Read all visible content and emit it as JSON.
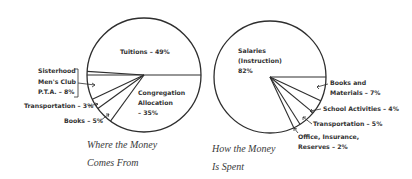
{
  "chart_data": [
    {
      "type": "pie",
      "title": "Where the Money Comes From",
      "caption_lines": [
        "Where the Money",
        "Comes From"
      ],
      "start_angle_deg": 0,
      "direction": "counterclockwise",
      "categories": [
        "Tuitions",
        "Sisterhood / Men's Club / P.T.A.",
        "Transportation",
        "Books",
        "Congregation Allocation"
      ],
      "values": [
        49,
        8,
        3,
        5,
        35
      ],
      "unit": "%",
      "labels": [
        {
          "lines": [
            "Tuitions – 49%"
          ],
          "x": 120,
          "y": 54,
          "anchor": "start"
        },
        {
          "lines": [
            "Sisterhood",
            "Men's Club",
            "P.T.A. – 8%"
          ],
          "x": 38,
          "y": 73,
          "anchor": "start",
          "line_height": 10.5
        },
        {
          "lines": [
            "Transportation – 3%"
          ],
          "x": 24,
          "y": 108,
          "anchor": "start"
        },
        {
          "lines": [
            "Books – 5%"
          ],
          "x": 64,
          "y": 123,
          "anchor": "start"
        },
        {
          "lines": [
            "Congregation",
            "Allocation",
            "– 35%"
          ],
          "x": 138,
          "y": 95,
          "anchor": "start",
          "line_height": 10
        }
      ]
    },
    {
      "type": "pie",
      "title": "How the Money Is Spent",
      "caption_lines": [
        "How the Money",
        "Is Spent"
      ],
      "start_angle_deg": 0,
      "direction": "clockwise",
      "categories": [
        "Books and Materials",
        "School Activities",
        "Transportation",
        "Office, Insurance, Reserves",
        "Salaries (Instruction)"
      ],
      "values": [
        7,
        4,
        5,
        2,
        82
      ],
      "unit": "%",
      "labels": [
        {
          "lines": [
            "Books and",
            "Materials – 7%"
          ],
          "x": 330,
          "y": 85,
          "anchor": "start",
          "line_height": 10
        },
        {
          "lines": [
            "School Activities – 4%"
          ],
          "x": 323,
          "y": 111,
          "anchor": "start"
        },
        {
          "lines": [
            "Transportation – 5%"
          ],
          "x": 313,
          "y": 126,
          "anchor": "start"
        },
        {
          "lines": [
            "Office, Insurance,",
            "Reserves – 2%"
          ],
          "x": 298,
          "y": 139,
          "anchor": "start",
          "line_height": 10
        },
        {
          "lines": [
            "Salaries",
            "(Instruction)",
            "82%"
          ],
          "x": 238,
          "y": 53,
          "anchor": "start",
          "line_height": 10
        }
      ]
    }
  ],
  "captions": {
    "left": {
      "line1": "Where the Money",
      "line2": "Comes From"
    },
    "right": {
      "line1": "How the Money",
      "line2": "Is Spent"
    }
  },
  "colors": {
    "ink": "#2e2e2e",
    "background": "#ffffff"
  }
}
